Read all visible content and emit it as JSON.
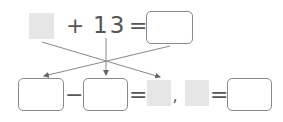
{
  "equation_top": {
    "blank_left": "",
    "plus": "+",
    "number": "13",
    "equals": "=",
    "answer_box": ""
  },
  "equation_bottom": {
    "box1": "",
    "minus": "−",
    "box2": "",
    "equals1": "=",
    "blank1": "",
    "comma": ",",
    "blank2": "",
    "equals2": "=",
    "box3": ""
  },
  "colors": {
    "blank_fill": "#e6e6e6",
    "box_border": "#8a8a8a",
    "arrow": "#777777",
    "text": "#555555"
  }
}
